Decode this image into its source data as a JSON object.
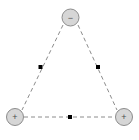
{
  "figure": {
    "canvas": {
      "width": 139,
      "height": 140,
      "background": "#ffffff"
    },
    "style": {
      "edge_color": "#8c8c8c",
      "edge_dash": "4 3",
      "edge_width": 1,
      "charge_fill": "#d6d6d6",
      "charge_stroke": "#8c8c8c",
      "charge_stroke_width": 1,
      "charge_radius": 8.5,
      "sign_color": "#4d4d4d",
      "midpoint_color": "#000000",
      "midpoint_size": 4
    },
    "charges": [
      {
        "id": "charge-top",
        "sign_label": "−",
        "polarity": "negative",
        "cx": 70.5,
        "cy": 17.5
      },
      {
        "id": "charge-bottom-left",
        "sign_label": "+",
        "polarity": "positive",
        "cx": 15.0,
        "cy": 117.0
      },
      {
        "id": "charge-bottom-right",
        "sign_label": "+",
        "polarity": "positive",
        "cx": 124.0,
        "cy": 117.0
      }
    ],
    "edges": [
      {
        "id": "edge-left",
        "x1": 63.0,
        "y1": 25.0,
        "x2": 22.0,
        "y2": 110.0
      },
      {
        "id": "edge-right",
        "x1": 78.0,
        "y1": 25.0,
        "x2": 117.0,
        "y2": 110.0
      },
      {
        "id": "edge-bottom",
        "x1": 24.0,
        "y1": 117.0,
        "x2": 115.0,
        "y2": 117.0
      }
    ],
    "midpoints": [
      {
        "id": "midpoint-left",
        "cx": 40.5,
        "cy": 67.0
      },
      {
        "id": "midpoint-right",
        "cx": 98.0,
        "cy": 67.0
      },
      {
        "id": "midpoint-bottom",
        "cx": 70.0,
        "cy": 117.0
      }
    ]
  }
}
